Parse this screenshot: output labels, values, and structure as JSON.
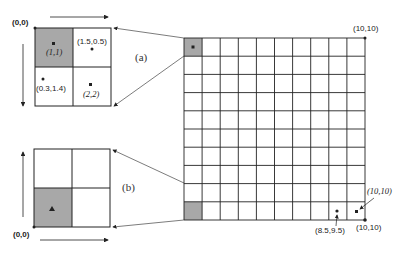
{
  "diagram": {
    "large_grid": {
      "cells": 10,
      "corner_top_right": "(10,10)",
      "corner_bottom_right": "(10,10)",
      "point_label": "(8.5,9.5)",
      "center_label": "(10,10)",
      "shaded": [
        "top-left",
        "bottom-left"
      ]
    },
    "panel_a": {
      "label": "(a)",
      "origin": "(0,0)",
      "center_1": "(1,1)",
      "center_2": "(2,2)",
      "point_1": "(1.5,0.5)",
      "point_2": "(0.3,1.4)"
    },
    "panel_b": {
      "label": "(b)",
      "origin": "(0,0)"
    },
    "colors": {
      "shade": "#a8a8a8",
      "line": "#222222"
    }
  }
}
